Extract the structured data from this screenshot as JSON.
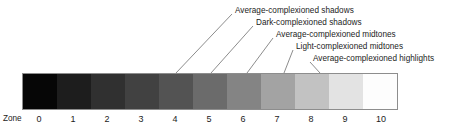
{
  "figure": {
    "name": "zone-system-grayscale-chart",
    "background_color": "#ffffff",
    "border_color": "#8d8d8d"
  },
  "callouts": [
    {
      "id": "average-complexioned-shadows",
      "label": "Average-complexioned shadows",
      "text_x": 235,
      "text_y": 6,
      "line_start_x": 232,
      "line_start_y": 14,
      "line_end_x": 176,
      "line_end_y": 73,
      "target_zone": 4
    },
    {
      "id": "dark-complexioned-shadows",
      "label": "Dark-complexioned shadows",
      "text_x": 256,
      "text_y": 18,
      "line_start_x": 253,
      "line_start_y": 26,
      "line_end_x": 211,
      "line_end_y": 73,
      "target_zone": 5
    },
    {
      "id": "average-complexioned-midtones",
      "label": "Average-complexioned midtones",
      "text_x": 276,
      "text_y": 30,
      "line_start_x": 273,
      "line_start_y": 38,
      "line_end_x": 247,
      "line_end_y": 73,
      "target_zone": 6
    },
    {
      "id": "light-complexioned-midtones",
      "label": "Light-complexioned midtones",
      "text_x": 296,
      "text_y": 42,
      "line_start_x": 293,
      "line_start_y": 50,
      "line_end_x": 284,
      "line_end_y": 73,
      "target_zone": 7
    },
    {
      "id": "average-complexioned-highlights",
      "label": "Average-complexioned highlights",
      "text_x": 313,
      "text_y": 54,
      "line_start_x": 310,
      "line_start_y": 62,
      "line_end_x": 320,
      "line_end_y": 73,
      "target_zone": 8
    }
  ],
  "chart_data": {
    "type": "bar",
    "title": "",
    "xlabel": "Zone",
    "ylabel": "",
    "axis_title": "Zone",
    "categories": [
      "0",
      "1",
      "2",
      "3",
      "4",
      "5",
      "6",
      "7",
      "8",
      "9",
      "10"
    ],
    "values": [
      0,
      10,
      20,
      30,
      40,
      50,
      60,
      70,
      80,
      90,
      100
    ],
    "swatch_colors": [
      "#060606",
      "#1d1d1d",
      "#303030",
      "#414141",
      "#535353",
      "#6b6b6b",
      "#848484",
      "#a3a3a3",
      "#c2c2c2",
      "#e3e3e3",
      "#fdfdfd"
    ],
    "legend_position": "above-right",
    "grid": false,
    "annotations": [
      "Average-complexioned shadows",
      "Dark-complexioned shadows",
      "Average-complexioned midtones",
      "Light-complexioned midtones",
      "Average-complexioned highlights"
    ]
  },
  "zone_axis": {
    "title": "Zone",
    "ticks": [
      {
        "label": "0",
        "x": 39
      },
      {
        "label": "1",
        "x": 73
      },
      {
        "label": "2",
        "x": 107
      },
      {
        "label": "3",
        "x": 141
      },
      {
        "label": "4",
        "x": 175
      },
      {
        "label": "5",
        "x": 209
      },
      {
        "label": "6",
        "x": 243
      },
      {
        "label": "7",
        "x": 277
      },
      {
        "label": "8",
        "x": 311
      },
      {
        "label": "9",
        "x": 345
      },
      {
        "label": "10",
        "x": 381
      }
    ]
  }
}
